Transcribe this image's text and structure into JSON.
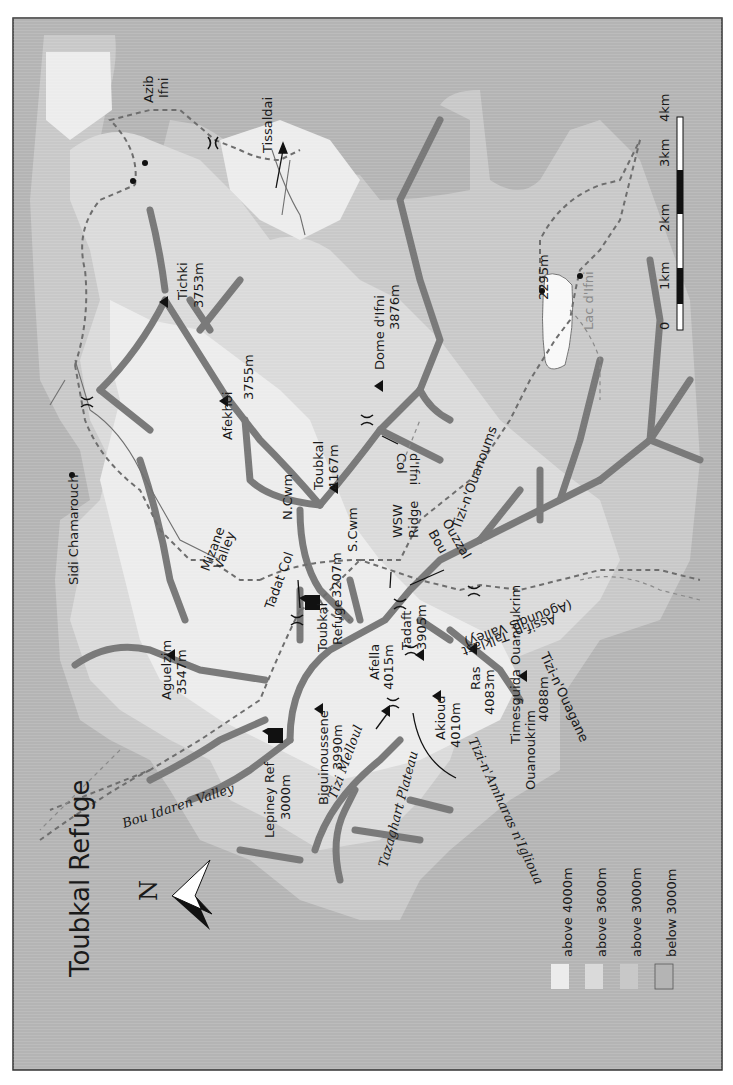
{
  "title": "Toubkal Refuge",
  "north_label": "N",
  "colors": {
    "below_3000": "#b4b4b4",
    "above_3000": "#c8c8c8",
    "above_3600": "#dadada",
    "above_4000": "#ececec",
    "border": "#333333",
    "ridge": "#7a7a7a"
  },
  "legend": [
    {
      "label": "above 4000m",
      "color": "#ececec"
    },
    {
      "label": "above 3600m",
      "color": "#dadada"
    },
    {
      "label": "above 3000m",
      "color": "#c8c8c8"
    },
    {
      "label": "below 3000m",
      "color": "#b4b4b4"
    }
  ],
  "scale_bar": {
    "ticks": [
      "0",
      "1km",
      "2km",
      "3km",
      "4km"
    ]
  },
  "peaks": [
    {
      "name": "Tichki",
      "elevation": "3753m"
    },
    {
      "name": "Afekhoi",
      "elevation": "3755m"
    },
    {
      "name": "Toubkal",
      "elevation": "4167m"
    },
    {
      "name": "Dome d'Ifni",
      "elevation": "3876m"
    },
    {
      "name": "Aguelzim",
      "elevation": "3547m"
    },
    {
      "name": "Biguinoussene",
      "elevation": "3990m"
    },
    {
      "name": "Afella",
      "elevation": "4015m"
    },
    {
      "name": "Tadaft",
      "elevation": "3905m"
    },
    {
      "name": "Akioud",
      "elevation": "4010m"
    },
    {
      "name": "Ras",
      "elevation": "4083m"
    },
    {
      "name": "Timesguida Ouanoukrim",
      "elevation": "4088m"
    }
  ],
  "labels": {
    "azib_1": "Azib",
    "azib_2": "Ifni",
    "tissaldai": "Tissaldai",
    "lake_elev": "2295m",
    "lake": "Lac d'Ifni",
    "sidi": "Sidi Chamarouch",
    "mizane_1": "Mizane",
    "mizane_2": "Valley",
    "ncwm": "N.Cwm",
    "scwm": "S.Cwm",
    "col_ifni_1": "Col",
    "col_ifni_2": "d'Ifni",
    "wsw_1": "WSW",
    "wsw_2": "Ridge",
    "tizi_ouanoums": "Tizi-n'Ouanoums",
    "bou_1": "Bou",
    "bou_2": "Ouzzal",
    "tadat_col": "Tadat Col",
    "refuge_1": "Toubkal",
    "refuge_2": "Refuge",
    "refuge_elev": "3207m",
    "agoundis": "(Agoundis Valley)",
    "assif": "Assif-n' Talklast",
    "tizi_ouagane": "Tizi-n'Ouagane",
    "tizi_melloul": "Tizi Melloul",
    "amharas": "Tizi-n'Amharas n'Iglioua",
    "lepiney_1": "Lepiney Ref",
    "lepiney_2": "3000m",
    "tazaghart": "Tazaghart Plateau",
    "bou_idaren": "Bou Idaren Valley"
  }
}
